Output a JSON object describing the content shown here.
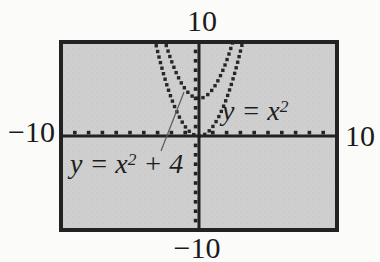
{
  "figure_title": "Graphing calculator viewing window showing y = x2 and y = x2 + 4",
  "window_labels": {
    "top": "10",
    "bottom": "−10",
    "left": "−10",
    "right": "10"
  },
  "curve_labels": {
    "f1": {
      "lhs": "y = x",
      "sup": "2",
      "suffix": ""
    },
    "f2": {
      "lhs": "y = x",
      "sup": "2",
      "suffix": " + 4"
    }
  },
  "colors": {
    "page_background": "#fbfbfa",
    "screen_fill_light": "#d9d9d9",
    "screen_fill_dark": "#c0c0c0",
    "ink": "#222222",
    "curve_dot": "#262626",
    "pointer_line": "#5a5a5a",
    "text": "#1b1b1b"
  },
  "chart_data": {
    "type": "line",
    "subtype": "function-plot-dotted",
    "title": "",
    "xlabel": "",
    "ylabel": "",
    "window": {
      "xmin": -10,
      "xmax": 10,
      "ymin": -10,
      "ymax": 10,
      "xscl": 1,
      "yscl": 1
    },
    "axis_edge_labels": {
      "top": "10",
      "bottom": "−10",
      "left": "−10",
      "right": "10"
    },
    "grid": false,
    "legend_position": "inline-annotations",
    "series": [
      {
        "name": "y = x^2",
        "a": 1,
        "c": 0,
        "style": "dotted",
        "annotation": "y = x2"
      },
      {
        "name": "y = x^2 + 4",
        "a": 1,
        "c": 4,
        "style": "dotted",
        "annotation": "y = x2 + 4",
        "pointer_from_label": true
      }
    ]
  }
}
